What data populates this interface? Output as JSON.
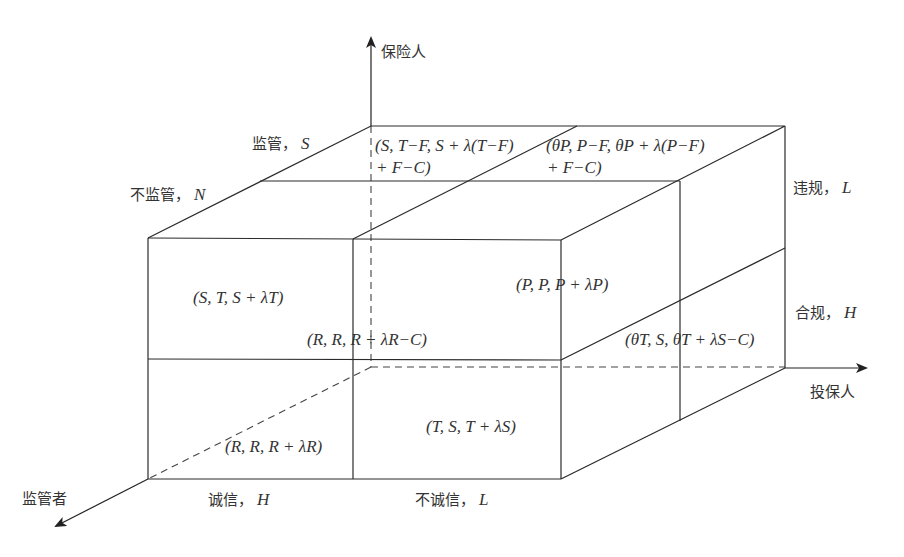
{
  "diagram": {
    "type": "3d-payoff-cube",
    "axes": {
      "vertical": {
        "label": "保险人"
      },
      "horizontal": {
        "label": "投保人"
      },
      "depth": {
        "label": "监管者"
      }
    },
    "strategies": {
      "regulator": [
        {
          "label": "监管，",
          "symbol": "S"
        },
        {
          "label": "不监管，",
          "symbol": "N"
        }
      ],
      "insurer": [
        {
          "label": "违规，",
          "symbol": "L"
        },
        {
          "label": "合规，",
          "symbol": "H"
        }
      ],
      "policyholder": [
        {
          "label": "诚信，",
          "symbol": "H"
        },
        {
          "label": "不诚信，",
          "symbol": "L"
        }
      ]
    },
    "payoffs": {
      "top_back_left_line1": "(S, T−F, S + λ(T−F)",
      "top_back_left_line2": "+ F−C)",
      "top_back_right_line1": "(θP, P−F, θP + λ(P−F)",
      "top_back_right_line2": "+ F−C)",
      "front_upper_left": "(S, T, S + λT)",
      "front_upper_right": "(P, P, P + λP)",
      "back_lower_left": "(R, R, R + λR−C)",
      "back_lower_right": "(θT, S, θT + λS−C)",
      "front_lower_left": "(R, R, R + λR)",
      "front_lower_right": "(T, S, T + λS)"
    }
  }
}
